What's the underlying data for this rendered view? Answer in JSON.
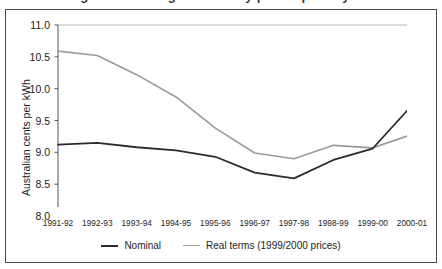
{
  "figure": {
    "title_remnant": "Figure 3: Average electricity prices paid by households"
  },
  "chart_data": {
    "type": "line",
    "title": "",
    "xlabel": "",
    "ylabel": "Australian cents per kWh",
    "categories": [
      "1991-92",
      "1992-93",
      "1993-94",
      "1994-95",
      "1995-96",
      "1996-97",
      "1997-98",
      "1998-99",
      "1999-00",
      "2000-01"
    ],
    "ylim": [
      8.0,
      11.0
    ],
    "ytick_labels": [
      "8.0",
      "8.5",
      "9.0",
      "9.5",
      "10.0",
      "10.5",
      "11.0"
    ],
    "ytick_values": [
      8.0,
      8.5,
      9.0,
      9.5,
      10.0,
      10.5,
      11.0
    ],
    "grid": false,
    "legend_position": "bottom",
    "series": [
      {
        "name": "Nominal",
        "color": "#2b2b2b",
        "width": 1.8,
        "values": [
          9.12,
          9.15,
          9.08,
          9.03,
          8.93,
          8.68,
          8.59,
          8.88,
          9.06,
          9.74
        ]
      },
      {
        "name": "Real terms (1999/2000 prices)",
        "color": "#9a9a9a",
        "width": 1.6,
        "values": [
          10.59,
          10.52,
          10.22,
          9.87,
          9.38,
          8.99,
          8.9,
          9.11,
          9.07,
          9.28
        ]
      }
    ]
  },
  "legend": {
    "items": [
      {
        "label": "Nominal",
        "color": "#2b2b2b"
      },
      {
        "label": "Real terms (1999/2000 prices)",
        "color": "#9a9a9a"
      }
    ]
  }
}
